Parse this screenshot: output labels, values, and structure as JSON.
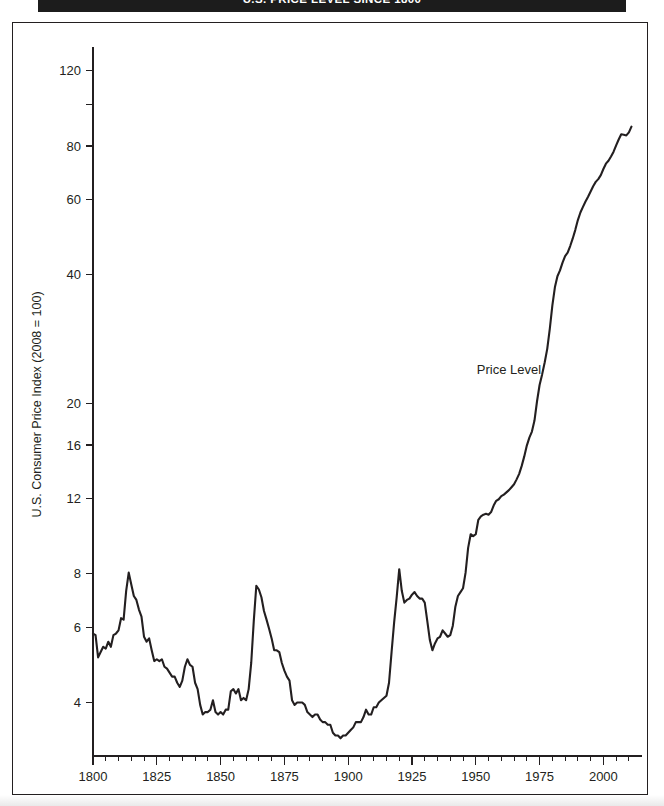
{
  "title": {
    "text": "U.S. PRICE LEVEL SINCE 1800",
    "background_color": "#1c1c1c",
    "text_color": "#ffffff"
  },
  "figure": {
    "border_color": "#231f20",
    "background_color": "#ffffff"
  },
  "annotation": {
    "label": "Price Level"
  },
  "chart_data": {
    "type": "line",
    "title": "U.S. PRICE LEVEL SINCE 1800",
    "xlabel": "",
    "ylabel": "U.S. Consumer Price Index (2008 = 100)",
    "yscale": "log",
    "ylim": [
      3.0,
      132
    ],
    "xlim": [
      1800,
      2012
    ],
    "grid": false,
    "legend": "none",
    "line_color": "#231f20",
    "y_tick_values": [
      4,
      6,
      8,
      12,
      16,
      20,
      40,
      60,
      80,
      100,
      120
    ],
    "y_tick_labels": [
      "4",
      "6",
      "8",
      "12",
      "16",
      "20",
      "40",
      "60",
      "80",
      "",
      "120"
    ],
    "x_tick_values": [
      1800,
      1825,
      1850,
      1875,
      1900,
      1925,
      1950,
      1975,
      2000
    ],
    "x_tick_labels": [
      "1800",
      "1825",
      "1850",
      "1875",
      "1900",
      "1925",
      "1950",
      "1975",
      "2000"
    ],
    "x_minor_step": 5,
    "series": [
      {
        "name": "Price Level",
        "x": [
          1800,
          1801,
          1802,
          1803,
          1804,
          1805,
          1806,
          1807,
          1808,
          1809,
          1810,
          1811,
          1812,
          1813,
          1814,
          1815,
          1816,
          1817,
          1818,
          1819,
          1820,
          1821,
          1822,
          1823,
          1824,
          1825,
          1826,
          1827,
          1828,
          1829,
          1830,
          1831,
          1832,
          1833,
          1834,
          1835,
          1836,
          1837,
          1838,
          1839,
          1840,
          1841,
          1842,
          1843,
          1844,
          1845,
          1846,
          1847,
          1848,
          1849,
          1850,
          1851,
          1852,
          1853,
          1854,
          1855,
          1856,
          1857,
          1858,
          1859,
          1860,
          1861,
          1862,
          1863,
          1864,
          1865,
          1866,
          1867,
          1868,
          1869,
          1870,
          1871,
          1872,
          1873,
          1874,
          1875,
          1876,
          1877,
          1878,
          1879,
          1880,
          1881,
          1882,
          1883,
          1884,
          1885,
          1886,
          1887,
          1888,
          1889,
          1890,
          1891,
          1892,
          1893,
          1894,
          1895,
          1896,
          1897,
          1898,
          1899,
          1900,
          1901,
          1902,
          1903,
          1904,
          1905,
          1906,
          1907,
          1908,
          1909,
          1910,
          1911,
          1912,
          1913,
          1914,
          1915,
          1916,
          1917,
          1918,
          1919,
          1920,
          1921,
          1922,
          1923,
          1924,
          1925,
          1926,
          1927,
          1928,
          1929,
          1930,
          1931,
          1932,
          1933,
          1934,
          1935,
          1936,
          1937,
          1938,
          1939,
          1940,
          1941,
          1942,
          1943,
          1944,
          1945,
          1946,
          1947,
          1948,
          1949,
          1950,
          1951,
          1952,
          1953,
          1954,
          1955,
          1956,
          1957,
          1958,
          1959,
          1960,
          1961,
          1962,
          1963,
          1964,
          1965,
          1966,
          1967,
          1968,
          1969,
          1970,
          1971,
          1972,
          1973,
          1974,
          1975,
          1976,
          1977,
          1978,
          1979,
          1980,
          1981,
          1982,
          1983,
          1984,
          1985,
          1986,
          1987,
          1988,
          1989,
          1990,
          1991,
          1992,
          1993,
          1994,
          1995,
          1996,
          1997,
          1998,
          1999,
          2000,
          2001,
          2002,
          2003,
          2004,
          2005,
          2006,
          2007,
          2008,
          2009,
          2010,
          2011
        ],
        "values": [
          5.8,
          5.75,
          5.1,
          5.25,
          5.4,
          5.35,
          5.55,
          5.4,
          5.75,
          5.8,
          5.9,
          6.3,
          6.25,
          7.3,
          8.05,
          7.55,
          7.1,
          6.95,
          6.6,
          6.35,
          5.7,
          5.55,
          5.65,
          5.3,
          5.0,
          5.05,
          5.0,
          5.05,
          4.85,
          4.8,
          4.7,
          4.6,
          4.6,
          4.45,
          4.35,
          4.5,
          4.85,
          5.05,
          4.9,
          4.85,
          4.45,
          4.3,
          3.95,
          3.75,
          3.8,
          3.8,
          3.85,
          4.05,
          3.8,
          3.75,
          3.8,
          3.75,
          3.85,
          3.85,
          4.25,
          4.3,
          4.2,
          4.3,
          4.05,
          4.1,
          4.05,
          4.3,
          4.95,
          6.2,
          7.5,
          7.35,
          7.05,
          6.55,
          6.25,
          5.95,
          5.65,
          5.3,
          5.3,
          5.25,
          4.95,
          4.75,
          4.6,
          4.5,
          4.05,
          3.95,
          4.0,
          4.0,
          4.0,
          3.95,
          3.8,
          3.75,
          3.7,
          3.75,
          3.75,
          3.65,
          3.6,
          3.6,
          3.55,
          3.55,
          3.4,
          3.35,
          3.35,
          3.3,
          3.35,
          3.35,
          3.4,
          3.45,
          3.5,
          3.6,
          3.6,
          3.6,
          3.7,
          3.85,
          3.75,
          3.75,
          3.9,
          3.9,
          4.0,
          4.05,
          4.1,
          4.15,
          4.45,
          5.25,
          6.15,
          7.05,
          8.2,
          7.3,
          6.85,
          6.95,
          7.0,
          7.15,
          7.25,
          7.1,
          7.0,
          7.0,
          6.85,
          6.2,
          5.6,
          5.3,
          5.5,
          5.65,
          5.7,
          5.9,
          5.8,
          5.7,
          5.75,
          6.05,
          6.7,
          7.1,
          7.25,
          7.4,
          8.05,
          9.2,
          9.9,
          9.8,
          9.9,
          10.7,
          10.9,
          11.0,
          11.05,
          11.0,
          11.15,
          11.55,
          11.85,
          11.95,
          12.15,
          12.25,
          12.4,
          12.55,
          12.75,
          12.95,
          13.3,
          13.7,
          14.3,
          15.05,
          15.95,
          16.65,
          17.2,
          18.25,
          20.25,
          22.1,
          23.4,
          24.95,
          26.85,
          29.9,
          33.9,
          37.4,
          39.7,
          40.95,
          42.7,
          44.25,
          45.05,
          46.7,
          48.65,
          50.95,
          53.7,
          55.95,
          57.65,
          59.35,
          60.9,
          62.6,
          64.45,
          65.95,
          66.95,
          68.4,
          70.7,
          72.75,
          73.9,
          75.6,
          77.6,
          80.25,
          82.85,
          85.2,
          85.0,
          84.7,
          86.1,
          88.8
        ]
      }
    ],
    "annotations": [
      {
        "text": "Price Level",
        "x": 1963,
        "y": 23.5
      }
    ],
    "notable_events": [
      {
        "label": "War of 1812 peak",
        "year": 1814,
        "value": 8.05
      },
      {
        "label": "Mid-century trough",
        "year": 1843,
        "value": 3.95
      },
      {
        "label": "Civil War peak",
        "year": 1864,
        "value": 7.5
      },
      {
        "label": "Deflation trough",
        "year": 1896,
        "value": 3.35
      },
      {
        "label": "WWI peak",
        "year": 1920,
        "value": 8.2
      },
      {
        "label": "Great Depression trough",
        "year": 1933,
        "value": 5.3
      },
      {
        "label": "End of series",
        "year": 2011,
        "value": 88.8
      }
    ]
  }
}
